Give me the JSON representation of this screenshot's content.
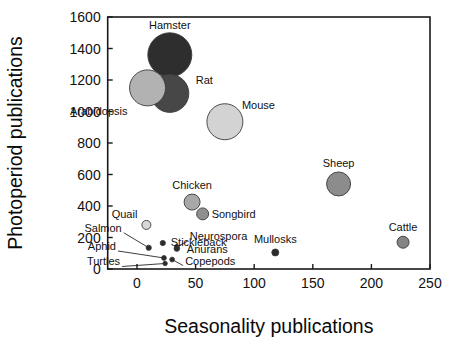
{
  "chart_data": {
    "type": "scatter",
    "title": "",
    "xlabel": "Seasonality publications",
    "ylabel": "Photoperiod publications",
    "xlim": [
      -25,
      250
    ],
    "ylim": [
      0,
      1600
    ],
    "xticks": [
      0,
      50,
      100,
      150,
      200,
      250
    ],
    "yticks": [
      0,
      200,
      400,
      600,
      800,
      1000,
      1200,
      1400,
      1600
    ],
    "xtick_labels": [
      "0",
      "50",
      "100",
      "150",
      "200",
      "250"
    ],
    "ytick_labels": [
      "0",
      "200",
      "400",
      "600",
      "800",
      "1000",
      "1200",
      "1400",
      "1600"
    ],
    "grid": false,
    "legend": "none",
    "bubble_note": "Marker area scales with a third variable (total publications)",
    "points": [
      {
        "label": "Hamster",
        "x": 28,
        "y": 1360,
        "r_px": 22.0,
        "color": "#2e2e2e",
        "label_dx": 0,
        "label_dy": -26,
        "label_anchor": "middle",
        "leader": false
      },
      {
        "label": "Rat",
        "x": 28,
        "y": 1115,
        "r_px": 19.0,
        "color": "#474747",
        "label_dx": 26,
        "label_dy": -9,
        "label_anchor": "start",
        "leader": false
      },
      {
        "label": "Arabidopsis",
        "x": 9,
        "y": 1150,
        "r_px": 18.0,
        "color": "#b2b2b2",
        "label_dx": -20,
        "label_dy": 27,
        "label_anchor": "end",
        "leader": false
      },
      {
        "label": "Mouse",
        "x": 75,
        "y": 935,
        "r_px": 18.0,
        "color": "#d3d3d3",
        "label_dx": 17,
        "label_dy": -13,
        "label_anchor": "start",
        "leader": false
      },
      {
        "label": "Sheep",
        "x": 172,
        "y": 540,
        "r_px": 12.0,
        "color": "#8c8c8c",
        "label_dx": 0,
        "label_dy": -17,
        "label_anchor": "middle",
        "leader": false
      },
      {
        "label": "Chicken",
        "x": 47,
        "y": 425,
        "r_px": 8.0,
        "color": "#a8a8a8",
        "label_dx": 0,
        "label_dy": -13,
        "label_anchor": "middle",
        "leader": false
      },
      {
        "label": "Songbird",
        "x": 56,
        "y": 350,
        "r_px": 6.0,
        "color": "#8f8f8f",
        "label_dx": 9,
        "label_dy": 4,
        "label_anchor": "start",
        "leader": false
      },
      {
        "label": "Cattle",
        "x": 227,
        "y": 170,
        "r_px": 6.0,
        "color": "#848484",
        "label_dx": 0,
        "label_dy": -11,
        "label_anchor": "middle",
        "leader": false
      },
      {
        "label": "Mullosks",
        "x": 118,
        "y": 105,
        "r_px": 3.5,
        "color": "#2b2b2b",
        "label_dx": 0,
        "label_dy": -9,
        "label_anchor": "middle",
        "leader": false
      },
      {
        "label": "Quail",
        "x": 8,
        "y": 280,
        "r_px": 4.5,
        "color": "#d8d8d8",
        "label_dx": -9,
        "label_dy": -7,
        "label_anchor": "end",
        "leader": false
      },
      {
        "label": "Stickleback",
        "x": 22,
        "y": 165,
        "r_px": 2.6,
        "color": "#2b2b2b",
        "label_dx": 8,
        "label_dy": 3,
        "label_anchor": "start",
        "leader": false
      },
      {
        "label": "Salmon",
        "x": 10,
        "y": 135,
        "r_px": 2.6,
        "color": "#2b2b2b",
        "label_dx": -27,
        "label_dy": -16,
        "label_anchor": "end",
        "leader": true
      },
      {
        "label": "Neurospora",
        "x": 34,
        "y": 140,
        "r_px": 2.4,
        "color": "#2b2b2b",
        "label_dx": 13,
        "label_dy": -7,
        "label_anchor": "start",
        "leader": true
      },
      {
        "label": "Anurans",
        "x": 34,
        "y": 130,
        "r_px": 2.8,
        "color": "#2b2b2b",
        "label_dx": 10,
        "label_dy": 4,
        "label_anchor": "start",
        "leader": false
      },
      {
        "label": "Aphid",
        "x": 23,
        "y": 70,
        "r_px": 2.4,
        "color": "#2b2b2b",
        "label_dx": -48,
        "label_dy": -8,
        "label_anchor": "end",
        "leader": true
      },
      {
        "label": "Copepods",
        "x": 30,
        "y": 60,
        "r_px": 2.4,
        "color": "#2b2b2b",
        "label_dx": 13,
        "label_dy": 5,
        "label_anchor": "start",
        "leader": true
      },
      {
        "label": "Turtles",
        "x": 24,
        "y": 35,
        "r_px": 2.2,
        "color": "#2b2b2b",
        "label_dx": -45,
        "label_dy": 2,
        "label_anchor": "end",
        "leader": true
      }
    ]
  }
}
